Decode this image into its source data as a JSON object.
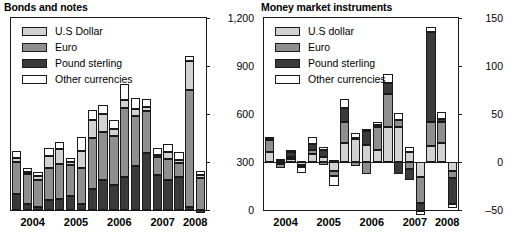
{
  "colors": {
    "usd": "#d2d2d2",
    "eur": "#8f8f8f",
    "gbp": "#3a3a3a",
    "other": "#ffffff",
    "axis": "#1a1a1a",
    "background": "#ffffff"
  },
  "panels": {
    "left": {
      "title": "Bonds and notes",
      "legend": [
        {
          "key": "usd",
          "label": "U.S Dollar",
          "color": "#d2d2d2"
        },
        {
          "key": "eur",
          "label": "Euro",
          "color": "#8f8f8f"
        },
        {
          "key": "gbp",
          "label": "Pound sterling",
          "color": "#3a3a3a"
        },
        {
          "key": "other",
          "label": "Other currencies",
          "color": "#ffffff"
        }
      ],
      "yticks": [
        "1,200",
        "900",
        "600",
        "300",
        "0"
      ],
      "xticks": [
        "2004",
        "2005",
        "2006",
        "2007",
        "2008"
      ]
    },
    "right": {
      "title": "Money market instruments",
      "legend": [
        {
          "key": "usd",
          "label": "U.S dollar",
          "color": "#d2d2d2"
        },
        {
          "key": "eur",
          "label": "Euro",
          "color": "#8f8f8f"
        },
        {
          "key": "gbp",
          "label": "Pound sterling",
          "color": "#3a3a3a"
        },
        {
          "key": "other",
          "label": "Other currencies",
          "color": "#ffffff"
        }
      ],
      "yticks": [
        "150",
        "100",
        "50",
        "0",
        "‒50"
      ],
      "xticks": [
        "2004",
        "2005",
        "2006",
        "2007",
        "2008"
      ]
    }
  },
  "chart_data": [
    {
      "id": "bonds-and-notes",
      "type": "bar",
      "stacked": true,
      "title": "Bonds and notes",
      "xlabel": "",
      "ylabel": "",
      "ylim": [
        0,
        1200
      ],
      "yticks": [
        0,
        300,
        600,
        900,
        1200
      ],
      "ytick_labels": [
        "0",
        "300",
        "600",
        "900",
        "1,200"
      ],
      "grid": false,
      "legend_position": "top-left",
      "x": [
        "2004Q1",
        "2004Q2",
        "2004Q3",
        "2004Q4",
        "2005Q1",
        "2005Q2",
        "2005Q3",
        "2005Q4",
        "2006Q1",
        "2006Q2",
        "2006Q3",
        "2006Q4",
        "2007Q1",
        "2007Q2",
        "2007Q3",
        "2007Q4",
        "2008Q1",
        "2008Q2"
      ],
      "group_labels": [
        "2004",
        "2005",
        "2006",
        "2007",
        "2008"
      ],
      "series": [
        {
          "name": "Pound sterling",
          "key": "gbp",
          "values": [
            100,
            35,
            20,
            65,
            70,
            85,
            35,
            130,
            190,
            155,
            205,
            275,
            355,
            220,
            185,
            205,
            20,
            -20
          ]
        },
        {
          "name": "Euro",
          "key": "eur",
          "values": [
            200,
            190,
            165,
            200,
            215,
            195,
            230,
            320,
            295,
            305,
            430,
            315,
            265,
            110,
            135,
            90,
            730,
            200
          ]
        },
        {
          "name": "U.S Dollar",
          "key": "usd",
          "values": [
            25,
            15,
            25,
            75,
            95,
            20,
            105,
            115,
            115,
            45,
            55,
            40,
            25,
            15,
            40,
            20,
            180,
            20
          ]
        },
        {
          "name": "Other currencies",
          "key": "other",
          "values": [
            45,
            25,
            30,
            45,
            45,
            25,
            85,
            60,
            55,
            60,
            95,
            70,
            50,
            40,
            50,
            45,
            35,
            25
          ]
        }
      ],
      "totals": [
        370,
        265,
        240,
        385,
        425,
        325,
        455,
        625,
        655,
        565,
        785,
        700,
        695,
        385,
        410,
        360,
        965,
        225
      ]
    },
    {
      "id": "money-market-instruments",
      "type": "bar",
      "stacked": true,
      "title": "Money market instruments",
      "xlabel": "",
      "ylabel": "",
      "ylim": [
        -50,
        150
      ],
      "yticks": [
        -50,
        0,
        50,
        100,
        150
      ],
      "ytick_labels": [
        "‒50",
        "0",
        "50",
        "100",
        "150"
      ],
      "grid": false,
      "legend_position": "top-left",
      "x": [
        "2004Q1",
        "2004Q2",
        "2004Q3",
        "2004Q4",
        "2005Q1",
        "2005Q2",
        "2005Q3",
        "2005Q4",
        "2006Q1",
        "2006Q2",
        "2006Q3",
        "2006Q4",
        "2007Q1",
        "2007Q2",
        "2007Q3",
        "2007Q4",
        "2008Q1",
        "2008Q2"
      ],
      "group_labels": [
        "2004",
        "2005",
        "2006",
        "2007",
        "2008"
      ],
      "series": [
        {
          "name": "U.S dollar",
          "key": "usd",
          "values": [
            10,
            -2,
            3,
            -3,
            8,
            5,
            -9,
            20,
            24,
            18,
            12,
            36,
            36,
            10,
            -16,
            17,
            20,
            -9
          ]
        },
        {
          "name": "Euro",
          "key": "eur",
          "values": [
            13,
            -4,
            2,
            -2,
            4,
            -3,
            -6,
            22,
            -4,
            -12,
            24,
            35,
            8,
            -7,
            -27,
            25,
            22,
            -8
          ]
        },
        {
          "name": "Pound sterling",
          "key": "gbp",
          "values": [
            1,
            2,
            5,
            1,
            7,
            7,
            2,
            14,
            1,
            14,
            3,
            11,
            -12,
            -12,
            -8,
            93,
            3,
            -27
          ]
        },
        {
          "name": "Other currencies",
          "key": "other",
          "values": [
            2,
            1,
            2,
            -6,
            7,
            4,
            -10,
            10,
            5,
            2,
            3,
            10,
            7,
            6,
            -4,
            6,
            7,
            -4
          ]
        }
      ],
      "totals": [
        26,
        -3,
        12,
        -10,
        26,
        13,
        -23,
        66,
        26,
        22,
        42,
        92,
        39,
        -3,
        -55,
        141,
        52,
        -48
      ]
    }
  ]
}
